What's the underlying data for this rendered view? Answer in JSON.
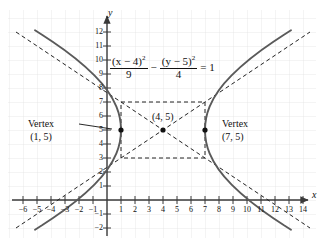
{
  "figure": {
    "type": "hyperbola-graph",
    "axis_labels": {
      "x": "x",
      "y": "y"
    },
    "equation": {
      "frac1_num": "(x − 4)",
      "frac1_num_exp": "2",
      "frac1_den": "9",
      "operator": "−",
      "frac2_num": "(y − 5)",
      "frac2_num_exp": "2",
      "frac2_den": "4",
      "equals": "= 1"
    },
    "annotations": {
      "vertex_left_title": "Vertex",
      "vertex_left_point": "(1, 5)",
      "vertex_right_title": "Vertex",
      "vertex_right_point": "(7, 5)",
      "center_point": "(4, 5)"
    },
    "x_ticks": [
      "−6",
      "−5",
      "−4",
      "−3",
      "−2",
      "−1",
      "1",
      "2",
      "3",
      "4",
      "5",
      "6",
      "7",
      "8",
      "9",
      "10",
      "11",
      "12",
      "13",
      "14"
    ],
    "y_ticks": [
      "12",
      "11",
      "10",
      "9",
      "8",
      "7",
      "6",
      "5",
      "4",
      "3",
      "2",
      "1",
      "−1",
      "−2"
    ],
    "colors": {
      "grid": "#dcdcdc",
      "axis": "#444444",
      "curve": "#555555",
      "dash": "#222222",
      "text": "#111111"
    }
  },
  "chart_data": {
    "type": "line",
    "title": "",
    "xlabel": "x",
    "ylabel": "y",
    "xlim": [
      -7,
      15
    ],
    "ylim": [
      -2.6,
      12.6
    ],
    "grid": true,
    "legend": "none",
    "conic": {
      "kind": "hyperbola",
      "orientation": "horizontal",
      "equation": "(x-4)^2/9 - (y-5)^2/4 = 1",
      "center": [
        4,
        5
      ],
      "a": 3,
      "b": 2,
      "vertices": [
        [
          1,
          5
        ],
        [
          7,
          5
        ]
      ],
      "asymptote_slopes": [
        0.6666667,
        -0.6666667
      ],
      "asymptotes": [
        "y - 5 = (2/3)(x - 4)",
        "y - 5 = -(2/3)(x - 4)"
      ],
      "reference_rectangle": {
        "x": [
          1,
          7
        ],
        "y": [
          3,
          7
        ]
      }
    },
    "series": [
      {
        "name": "right branch",
        "style": "solid"
      },
      {
        "name": "left branch",
        "style": "solid"
      },
      {
        "name": "asymptote +2/3",
        "style": "dashed"
      },
      {
        "name": "asymptote -2/3",
        "style": "dashed"
      },
      {
        "name": "reference rectangle",
        "style": "dashed"
      }
    ],
    "points": [
      {
        "label": "(4, 5)",
        "x": 4,
        "y": 5,
        "marker": "dot"
      },
      {
        "label": "(1, 5)",
        "x": 1,
        "y": 5,
        "marker": "dot"
      },
      {
        "label": "(7, 5)",
        "x": 7,
        "y": 5,
        "marker": "dot"
      }
    ],
    "x_tick_values": [
      -6,
      -5,
      -4,
      -3,
      -2,
      -1,
      1,
      2,
      3,
      4,
      5,
      6,
      7,
      8,
      9,
      10,
      11,
      12,
      13,
      14
    ],
    "y_tick_values": [
      12,
      11,
      10,
      9,
      8,
      7,
      6,
      5,
      4,
      3,
      2,
      1,
      -1,
      -2
    ]
  }
}
